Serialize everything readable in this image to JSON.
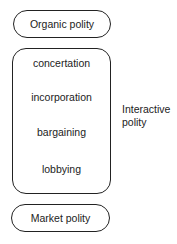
{
  "top": {
    "label": "Organic polity"
  },
  "middle": {
    "items": [
      "concertation",
      "incorporation",
      "bargaining",
      "lobbying"
    ],
    "side_label_line1": "Interactive",
    "side_label_line2": "polity"
  },
  "bottom": {
    "label": "Market polity"
  }
}
